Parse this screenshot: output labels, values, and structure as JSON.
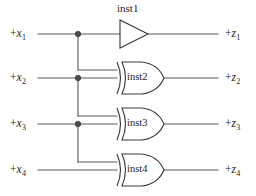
{
  "diagram": {
    "width": 256,
    "height": 196,
    "background_color": "#ffffff",
    "wire_color": "#5a5a5a",
    "gate_color": "#3d3d3d",
    "junction_color": "#4a4a4a"
  },
  "inputs": [
    {
      "id": "x1",
      "sign": "+",
      "var": "x",
      "index": "1",
      "y": 34
    },
    {
      "id": "x2",
      "sign": "+",
      "var": "x",
      "index": "2",
      "y": 78
    },
    {
      "id": "x3",
      "sign": "+",
      "var": "x",
      "index": "3",
      "y": 124
    },
    {
      "id": "x4",
      "sign": "+",
      "var": "x",
      "index": "4",
      "y": 170
    }
  ],
  "outputs": [
    {
      "id": "z1",
      "sign": "+",
      "var": "z",
      "index": "1",
      "y": 34
    },
    {
      "id": "z2",
      "sign": "+",
      "var": "z",
      "index": "2",
      "y": 78
    },
    {
      "id": "z3",
      "sign": "+",
      "var": "z",
      "index": "3",
      "y": 124
    },
    {
      "id": "z4",
      "sign": "+",
      "var": "z",
      "index": "4",
      "y": 170
    }
  ],
  "gates": [
    {
      "id": "inst1",
      "label": "inst1",
      "type": "buffer",
      "label_position": "above",
      "y": 34,
      "inputs": [
        "x1"
      ],
      "output": "z1"
    },
    {
      "id": "inst2",
      "label": "inst2",
      "type": "xor",
      "label_position": "inside",
      "y": 78,
      "inputs": [
        "x1",
        "x2"
      ],
      "output": "z2"
    },
    {
      "id": "inst3",
      "label": "inst3",
      "type": "xor",
      "label_position": "inside",
      "y": 124,
      "inputs": [
        "x2",
        "x3"
      ],
      "output": "z3"
    },
    {
      "id": "inst4",
      "label": "inst4",
      "type": "xor",
      "label_position": "inside",
      "y": 170,
      "inputs": [
        "x3",
        "x4"
      ],
      "output": "z4"
    }
  ],
  "junctions": [
    {
      "id": "tap-x1",
      "x": 78,
      "y": 34,
      "source": "x1"
    },
    {
      "id": "tap-x2",
      "x": 78,
      "y": 78,
      "source": "x2"
    },
    {
      "id": "tap-x3",
      "x": 78,
      "y": 124,
      "source": "x3"
    }
  ],
  "labels": {
    "inst1": "inst1",
    "inst2": "inst2",
    "inst3": "inst3",
    "inst4": "inst4"
  }
}
